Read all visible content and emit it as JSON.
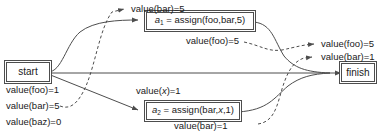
{
  "diagram": {
    "type": "control-flow-dataflow-graph",
    "nodes": {
      "start": {
        "label": "start"
      },
      "finish": {
        "label": "finish"
      },
      "action1": {
        "name": "a",
        "subscript": "1",
        "eq": " = assign(foo,bar,5)"
      },
      "action2": {
        "name": "a",
        "subscript": "2",
        "eq": " = assign(bar,",
        "var": "x",
        "eq_tail": ",1)"
      }
    },
    "labels": {
      "start_foo": "value(foo)=1",
      "start_bar": "value(bar)=5",
      "start_baz": "value(baz)=0",
      "top_bar": "value(bar)=5",
      "mid_foo": "value(foo)=5",
      "x_pre": "value(",
      "x_var": "x",
      "x_post": ")=1",
      "bottom_bar": "value(bar)=1",
      "out_foo": "value(foo)=5",
      "out_bar": "value(bar)=1"
    },
    "colors": {
      "stroke": "#4d4d4d",
      "text": "#1a1a1a",
      "background": "#ffffff"
    }
  }
}
